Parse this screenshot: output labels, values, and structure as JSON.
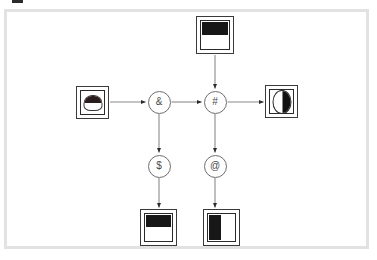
{
  "page": {
    "background_color": "#ffffff",
    "frame_color": "#e2e2e2",
    "corner_mark_color": "#2b2b2b",
    "line_color": "#8a8a8a",
    "node_border_color": "#3a3a3a",
    "glyph_fill_color": "#171717"
  },
  "diagram": {
    "type": "flowchart",
    "nodes": [
      {
        "id": "node-top",
        "kind": "box",
        "glyph": "top-band-box-icon",
        "x": 196,
        "y": 16,
        "w": 38,
        "h": 38
      },
      {
        "id": "node-left",
        "kind": "box",
        "glyph": "cylinder-icon",
        "x": 76,
        "y": 86,
        "w": 33,
        "h": 33
      },
      {
        "id": "node-right",
        "kind": "box",
        "glyph": "half-filled-ellipse-icon",
        "x": 265,
        "y": 85,
        "w": 33,
        "h": 33
      },
      {
        "id": "node-bottom-left",
        "kind": "box",
        "glyph": "top-band-box-icon",
        "x": 140,
        "y": 209,
        "w": 37,
        "h": 37
      },
      {
        "id": "node-bottom-right",
        "kind": "box",
        "glyph": "left-band-box-icon",
        "x": 203,
        "y": 209,
        "w": 37,
        "h": 37
      },
      {
        "id": "op-and",
        "kind": "circle",
        "label": "&",
        "cx": 159,
        "cy": 102
      },
      {
        "id": "op-hash",
        "kind": "circle",
        "label": "#",
        "cx": 215,
        "cy": 102
      },
      {
        "id": "op-dollar",
        "kind": "circle",
        "label": "$",
        "cx": 159,
        "cy": 166
      },
      {
        "id": "op-at",
        "kind": "circle",
        "label": "@",
        "cx": 215,
        "cy": 166
      }
    ],
    "edges": [
      {
        "id": "edge-left-to-and",
        "from": "node-left",
        "to": "op-and",
        "direction": "right"
      },
      {
        "id": "edge-and-to-hash",
        "from": "op-and",
        "to": "op-hash",
        "direction": "right"
      },
      {
        "id": "edge-hash-to-right",
        "from": "op-hash",
        "to": "node-right",
        "direction": "right"
      },
      {
        "id": "edge-top-to-hash",
        "from": "node-top",
        "to": "op-hash",
        "direction": "down"
      },
      {
        "id": "edge-and-to-dollar",
        "from": "op-and",
        "to": "op-dollar",
        "direction": "down"
      },
      {
        "id": "edge-dollar-to-bl",
        "from": "op-dollar",
        "to": "node-bottom-left",
        "direction": "down"
      },
      {
        "id": "edge-hash-to-at",
        "from": "op-hash",
        "to": "op-at",
        "direction": "down"
      },
      {
        "id": "edge-at-to-br",
        "from": "op-at",
        "to": "node-bottom-right",
        "direction": "down"
      }
    ]
  }
}
